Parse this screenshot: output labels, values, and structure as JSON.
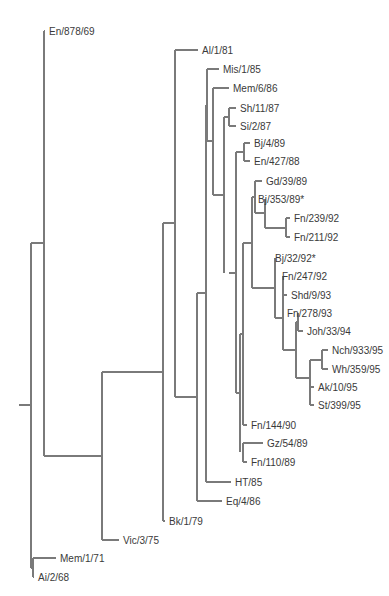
{
  "figure": {
    "type": "phylogenetic-tree",
    "line_color": "#7a7a7a",
    "text_color": "#3a3a3a"
  },
  "leaves": [
    {
      "id": "L1",
      "label": "En/878/69",
      "x": 45,
      "y": 31
    },
    {
      "id": "L2",
      "label": "Al/1/81",
      "x": 198,
      "y": 50
    },
    {
      "id": "L3",
      "label": "Mis/1/85",
      "x": 219,
      "y": 69
    },
    {
      "id": "L4",
      "label": "Mem/6/86",
      "x": 229,
      "y": 88
    },
    {
      "id": "L5",
      "label": "Sh/11/87",
      "x": 236,
      "y": 108
    },
    {
      "id": "L6",
      "label": "Si/2/87",
      "x": 236,
      "y": 126
    },
    {
      "id": "L7",
      "label": "Bj/4/89",
      "x": 250,
      "y": 143
    },
    {
      "id": "L8",
      "label": "En/427/88",
      "x": 250,
      "y": 161
    },
    {
      "id": "L9",
      "label": "Gd/39/89",
      "x": 262,
      "y": 181
    },
    {
      "id": "L10",
      "label": "Bj/353/89*",
      "x": 254,
      "y": 199
    },
    {
      "id": "L11",
      "label": "Fn/239/92",
      "x": 290,
      "y": 218
    },
    {
      "id": "L12",
      "label": "Fn/211/92",
      "x": 290,
      "y": 237
    },
    {
      "id": "L13",
      "label": "Bj/32/92*",
      "x": 271,
      "y": 258
    },
    {
      "id": "L14",
      "label": "Fn/247/92",
      "x": 278,
      "y": 276
    },
    {
      "id": "L15",
      "label": "Shd/9/93",
      "x": 287,
      "y": 295
    },
    {
      "id": "L16",
      "label": "Fn/278/93",
      "x": 283,
      "y": 313
    },
    {
      "id": "L17",
      "label": "Joh/33/94",
      "x": 303,
      "y": 331
    },
    {
      "id": "L18",
      "label": "Nch/933/95",
      "x": 328,
      "y": 350
    },
    {
      "id": "L19",
      "label": "Wh/359/95",
      "x": 328,
      "y": 369
    },
    {
      "id": "L20",
      "label": "Ak/10/95",
      "x": 314,
      "y": 387
    },
    {
      "id": "L21",
      "label": "St/399/95",
      "x": 314,
      "y": 405
    },
    {
      "id": "L22",
      "label": "Fn/144/90",
      "x": 247,
      "y": 425
    },
    {
      "id": "L23",
      "label": "Gz/54/89",
      "x": 263,
      "y": 443
    },
    {
      "id": "L24",
      "label": "Fn/110/89",
      "x": 247,
      "y": 462
    },
    {
      "id": "L25",
      "label": "HT/85",
      "x": 231,
      "y": 482
    },
    {
      "id": "L26",
      "label": "Eq/4/86",
      "x": 222,
      "y": 501
    },
    {
      "id": "L27",
      "label": "Bk/1/79",
      "x": 165,
      "y": 521
    },
    {
      "id": "L28",
      "label": "Vic/3/75",
      "x": 119,
      "y": 540
    },
    {
      "id": "L29",
      "label": "Mem/1/71",
      "x": 56,
      "y": 558
    },
    {
      "id": "L30",
      "label": "Ai/2/68",
      "x": 34,
      "y": 577
    }
  ],
  "internal_nodes": [
    {
      "id": "N_nch_wh",
      "x": 322,
      "children_y": [
        350,
        369
      ],
      "parent_x": 310,
      "y": 360
    },
    {
      "id": "N_ak_st",
      "x": 310,
      "children_y": [
        387,
        405
      ],
      "parent_x": 310,
      "y": 396
    },
    {
      "id": "N_late",
      "x": 310,
      "children_y": [
        360,
        396
      ],
      "parent_x": 296,
      "y": 378
    },
    {
      "id": "N_fn278_joh",
      "x": 298,
      "children_y": [
        313,
        331
      ],
      "parent_x": 296,
      "y": 322
    },
    {
      "id": "N_n1",
      "x": 296,
      "children_y": [
        322,
        378
      ],
      "parent_x": 283,
      "y": 350
    },
    {
      "id": "N_fn247_shd",
      "x": 283,
      "children_y": [
        276,
        295
      ],
      "parent_x": 283,
      "y": 286
    },
    {
      "id": "N_n2",
      "x": 283,
      "children_y": [
        286,
        350
      ],
      "parent_x": 275,
      "y": 318
    },
    {
      "id": "N_bj32",
      "x": 275,
      "children_y": [
        258,
        318
      ],
      "parent_x": 252,
      "y": 288
    },
    {
      "id": "N_fn239_211",
      "x": 286,
      "children_y": [
        218,
        237
      ],
      "parent_x": 265,
      "y": 228
    },
    {
      "id": "N_bj353",
      "x": 265,
      "children_y": [
        199,
        228
      ],
      "parent_x": 255,
      "y": 213
    },
    {
      "id": "N_gd",
      "x": 255,
      "children_y": [
        181,
        213
      ],
      "parent_x": 252,
      "y": 197
    },
    {
      "id": "N_n3",
      "x": 252,
      "children_y": [
        197,
        288
      ],
      "parent_x": 243,
      "y": 243
    },
    {
      "id": "N_gz_fn110",
      "x": 243,
      "children_y": [
        443,
        462
      ],
      "parent_x": 243,
      "y": 452
    },
    {
      "id": "N_n4",
      "x": 243,
      "children_y": [
        243,
        425
      ],
      "parent_x": 240,
      "y": 334
    },
    {
      "id": "N_n5",
      "x": 240,
      "children_y": [
        334,
        452
      ],
      "parent_x": 236,
      "y": 393
    },
    {
      "id": "N_bj4_en427",
      "x": 244,
      "children_y": [
        143,
        161
      ],
      "parent_x": 236,
      "y": 152
    },
    {
      "id": "N_n6",
      "x": 236,
      "children_y": [
        152,
        393
      ],
      "parent_x": 229,
      "y": 273
    },
    {
      "id": "N_sh_si",
      "x": 229,
      "children_y": [
        108,
        126
      ],
      "parent_x": 224,
      "y": 117
    },
    {
      "id": "N_n7",
      "x": 224,
      "children_y": [
        117,
        273
      ],
      "parent_x": 213,
      "y": 195
    },
    {
      "id": "N_mem6",
      "x": 213,
      "children_y": [
        88,
        195
      ],
      "parent_x": 207,
      "y": 141
    },
    {
      "id": "N_mis",
      "x": 207,
      "children_y": [
        69,
        141
      ],
      "parent_x": 206,
      "y": 105
    },
    {
      "id": "N_n8",
      "x": 206,
      "children_y": [
        105,
        482
      ],
      "parent_x": 197,
      "y": 293
    },
    {
      "id": "N_n9",
      "x": 197,
      "children_y": [
        293,
        501
      ],
      "parent_x": 175,
      "y": 397
    },
    {
      "id": "N_al",
      "x": 175,
      "children_y": [
        50,
        397
      ],
      "parent_x": 163,
      "y": 223
    },
    {
      "id": "N_bk",
      "x": 163,
      "children_y": [
        223,
        521
      ],
      "parent_x": 102,
      "y": 372
    },
    {
      "id": "N_vic",
      "x": 102,
      "children_y": [
        372,
        540
      ],
      "parent_x": 44,
      "y": 456
    },
    {
      "id": "N_en878",
      "x": 44,
      "children_y": [
        31,
        456
      ],
      "parent_x": 31,
      "y": 243
    },
    {
      "id": "N_mem1",
      "x": 33,
      "children_y": [
        558,
        577
      ],
      "parent_x": 31,
      "y": 568
    },
    {
      "id": "N_root",
      "x": 31,
      "children_y": [
        243,
        568
      ],
      "parent_x": 19,
      "y": 405
    }
  ]
}
